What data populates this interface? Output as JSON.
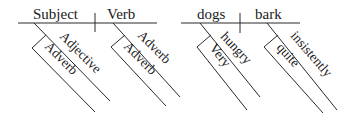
{
  "diagrams": [
    {
      "name": "template",
      "subject": "Subject",
      "verb": "Verb",
      "subject_modifier": "Adjective",
      "subject_modifier_adverb": "Adverb",
      "verb_modifier": "Adverb",
      "verb_modifier_adverb": "Adverb"
    },
    {
      "name": "example",
      "subject": "dogs",
      "verb": "bark",
      "subject_modifier": "hungry",
      "subject_modifier_adverb": "Very",
      "verb_modifier": "insistently",
      "verb_modifier_adverb": "quite"
    }
  ],
  "colors": {
    "line": "#2a2a2a",
    "text": "#1a1a1a",
    "background": "#ffffff"
  }
}
